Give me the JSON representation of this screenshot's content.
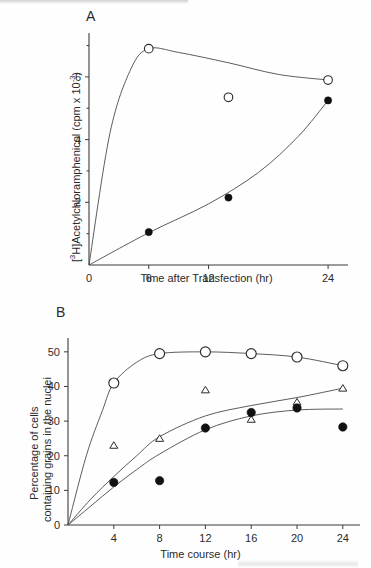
{
  "figure": {
    "panels": [
      {
        "letter": "A",
        "xlabel": "Time after Transfection (hr)",
        "ylabel_prefix": "[",
        "ylabel_sup1": "3",
        "ylabel_mid": "H]Acetylchloramphenicol (cpm x 10",
        "ylabel_sup2": "-3",
        "ylabel_suffix": ")",
        "x_ticks": [
          "0",
          "6",
          "12",
          "24"
        ],
        "y_ticks": [
          "2",
          "4",
          "6"
        ]
      },
      {
        "letter": "B",
        "xlabel": "Time course (hr)",
        "ylabel_line1": "Percentage of cells",
        "ylabel_line2": "containing grains in the nuclei",
        "x_ticks": [
          "0",
          "4",
          "8",
          "12",
          "16",
          "20",
          "24"
        ],
        "y_ticks": [
          "0",
          "10",
          "20",
          "30",
          "40",
          "50"
        ]
      }
    ]
  },
  "chart_data": [
    {
      "type": "scatter",
      "panel": "A",
      "title": "A",
      "xlabel": "Time after Transfection (hr)",
      "ylabel": "[3H]Acetylchloramphenicol (cpm x 10-3)",
      "xlim": [
        0,
        26
      ],
      "ylim": [
        0,
        7.4
      ],
      "xticks": [
        0,
        6,
        12,
        24
      ],
      "yticks": [
        2,
        4,
        6
      ],
      "yticks_minor": [
        1,
        3,
        5,
        7
      ],
      "grid": false,
      "legend": "none",
      "series": [
        {
          "name": "open-circle",
          "marker": "open circle",
          "x": [
            0,
            6,
            14,
            24
          ],
          "y": [
            0,
            6.9,
            5.35,
            5.9
          ],
          "curve_through": [
            0,
            6,
            24
          ],
          "curve_y": [
            0,
            6.9,
            5.9
          ]
        },
        {
          "name": "filled-circle",
          "marker": "filled circle",
          "x": [
            0,
            6,
            14,
            24
          ],
          "y": [
            0,
            1.05,
            2.15,
            5.25
          ],
          "curve_through": [
            0,
            6,
            14,
            24
          ],
          "curve_y": [
            0,
            1.05,
            2.15,
            5.25
          ]
        }
      ]
    },
    {
      "type": "scatter",
      "panel": "B",
      "title": "B",
      "xlabel": "Time course (hr)",
      "ylabel": "Percentage of cells containing grains in the nuclei",
      "xlim": [
        0,
        25.5
      ],
      "ylim": [
        0,
        54
      ],
      "xticks": [
        0,
        4,
        8,
        12,
        16,
        20,
        24
      ],
      "yticks": [
        0,
        10,
        20,
        30,
        40,
        50
      ],
      "grid": false,
      "legend": "none",
      "series": [
        {
          "name": "open-circle",
          "marker": "open circle",
          "x": [
            0,
            4,
            8,
            12,
            16,
            20,
            24
          ],
          "y": [
            0,
            41,
            49.5,
            50,
            49.5,
            48.5,
            46
          ]
        },
        {
          "name": "open-triangle",
          "marker": "open triangle",
          "x": [
            0,
            4,
            8,
            12,
            16,
            20,
            24
          ],
          "y": [
            0,
            23,
            25,
            39,
            30.5,
            35.5,
            39.5
          ],
          "curve_y": [
            0,
            14,
            25.5,
            31.5,
            34.5,
            36.8,
            39.5
          ]
        },
        {
          "name": "filled-circle",
          "marker": "filled circle",
          "x": [
            0,
            4,
            8,
            12,
            16,
            20,
            24
          ],
          "y": [
            0,
            12.3,
            12.8,
            28,
            32.5,
            33.8,
            28.3
          ],
          "curve_y": [
            0,
            11,
            20.5,
            27.5,
            31.5,
            33.2,
            33.5
          ]
        }
      ]
    }
  ]
}
